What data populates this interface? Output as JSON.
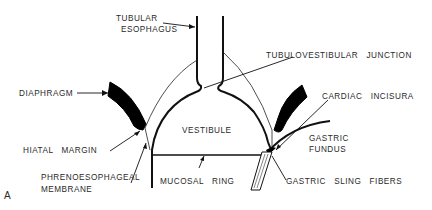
{
  "figure": {
    "panel_label": "A",
    "labels": {
      "tubular_esophagus_1": "TUBULAR",
      "tubular_esophagus_2": "ESOPHAGUS",
      "tubulovestibular_junction": "TUBULOVESTIBULAR   JUNCTION",
      "diaphragm": "DIAPHRAGM",
      "cardiac_incisura": "CARDIAC   INCISURA",
      "vestibule": "VESTIBULE",
      "gastric_fundus_1": "GASTRIC",
      "gastric_fundus_2": "FUNDUS",
      "hiatal_margin": "HIATAL   MARGIN",
      "phrenoesophageal_1": "PHRENOESOPHAGEAL",
      "phrenoesophageal_2": "MEMBRANE",
      "mucosal_ring": "MUCOSAL   RING",
      "gastric_sling_fibers": "GASTRIC   SLING   FIBERS"
    }
  }
}
